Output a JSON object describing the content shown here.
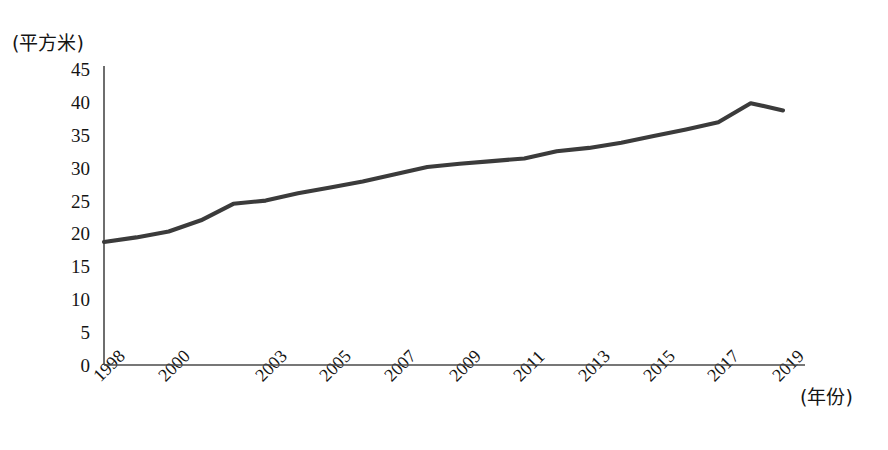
{
  "chart_data": {
    "type": "line",
    "title": "",
    "xlabel": "(年份)",
    "ylabel": "(平方米)",
    "ylim": [
      0,
      45
    ],
    "yticks": [
      "0",
      "5",
      "10",
      "15",
      "20",
      "25",
      "30",
      "35",
      "40",
      "45"
    ],
    "xticks": [
      "1998",
      "2000",
      "2003",
      "2005",
      "2007",
      "2009",
      "2011",
      "2013",
      "2015",
      "2017",
      "2019"
    ],
    "grid": false,
    "legend": "none",
    "x": [
      1998,
      1999,
      2000,
      2001,
      2002,
      2003,
      2004,
      2005,
      2006,
      2007,
      2008,
      2009,
      2010,
      2011,
      2012,
      2013,
      2014,
      2015,
      2016,
      2017,
      2018,
      2019
    ],
    "values": [
      18.7,
      19.4,
      20.3,
      22.0,
      24.5,
      25.0,
      26.1,
      27.0,
      27.9,
      29.0,
      30.1,
      30.6,
      31.0,
      31.4,
      32.5,
      33.0,
      33.8,
      34.8,
      35.8,
      36.9,
      39.8,
      38.7
    ],
    "series": [
      {
        "name": "人均住房建筑面积",
        "color": "#3b3b3b",
        "values": [
          18.7,
          19.4,
          20.3,
          22.0,
          24.5,
          25.0,
          26.1,
          27.0,
          27.9,
          29.0,
          30.1,
          30.6,
          31.0,
          31.4,
          32.5,
          33.0,
          33.8,
          34.8,
          35.8,
          36.9,
          39.8,
          38.7
        ]
      }
    ]
  },
  "axes": {
    "y_unit_label": "(平方米)",
    "x_unit_label": "(年份)"
  },
  "caption": {
    "text": ""
  },
  "colors": {
    "line": "#3b3b3b",
    "axis": "#4a4a4a",
    "text": "#141414",
    "background": "#ffffff"
  }
}
